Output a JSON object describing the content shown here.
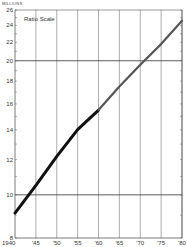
{
  "chart_data": {
    "type": "line",
    "title": "",
    "annotation": "Ratio Scale",
    "ylabel": "MILLIONS",
    "xlabel": "",
    "yscale": "log",
    "ylim": [
      8,
      26
    ],
    "y_ticks": [
      8,
      10,
      12,
      14,
      16,
      18,
      20,
      22,
      24,
      26
    ],
    "y_major_gridlines": [
      10,
      20
    ],
    "x_ticks": [
      1940,
      1945,
      1950,
      1955,
      1960,
      1965,
      1970,
      1975,
      1980
    ],
    "x_tick_labels": [
      "1940",
      "'45",
      "'50",
      "'55",
      "'60",
      "'65",
      "'70",
      "'75",
      "'80"
    ],
    "grid": true,
    "legend": null,
    "series": [
      {
        "name": "Actual",
        "style": "thick black",
        "x": [
          1940,
          1945,
          1950,
          1955,
          1960
        ],
        "values": [
          9.1,
          10.5,
          12.2,
          14.0,
          15.5
        ]
      },
      {
        "name": "Projected",
        "style": "thinner gray",
        "x": [
          1960,
          1965,
          1970,
          1975,
          1980
        ],
        "values": [
          15.5,
          17.5,
          19.6,
          21.8,
          24.6
        ]
      }
    ]
  },
  "labels": {
    "unit": "MILLIONS",
    "scale_note": "Ratio Scale"
  }
}
